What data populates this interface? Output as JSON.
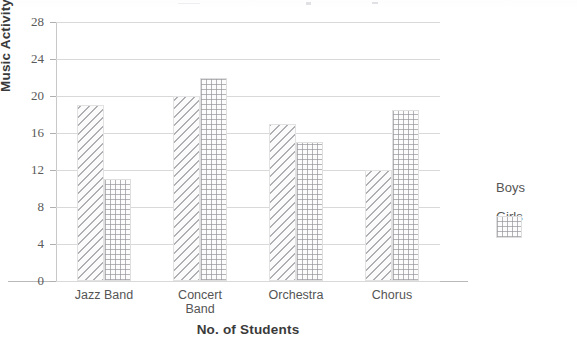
{
  "chart_data": {
    "type": "bar",
    "title": "",
    "xlabel": "No. of Students",
    "ylabel": "Music Activity",
    "categories": [
      "Jazz Band",
      "Concert\nBand",
      "Orchestra",
      "Chorus"
    ],
    "series": [
      {
        "name": "Boys",
        "values": [
          19,
          20,
          17,
          12
        ]
      },
      {
        "name": "Girls",
        "values": [
          11,
          22,
          15,
          18.5
        ]
      }
    ],
    "ylim": [
      0,
      28
    ],
    "yticks": [
      0,
      4,
      8,
      12,
      16,
      20,
      24,
      28
    ],
    "ytick_labels": [
      "0",
      "4",
      "8",
      "12",
      "16",
      "20",
      "24",
      "28"
    ],
    "grid": true,
    "legend_position": "right",
    "style": {
      "boys_pattern": "diagonal-hatch",
      "girls_pattern": "crosshatch-grid",
      "line_color": "#96969b",
      "grid_color": "#d9d9d9",
      "text_color": "#4a4a4a",
      "background": "#ffffff"
    }
  }
}
